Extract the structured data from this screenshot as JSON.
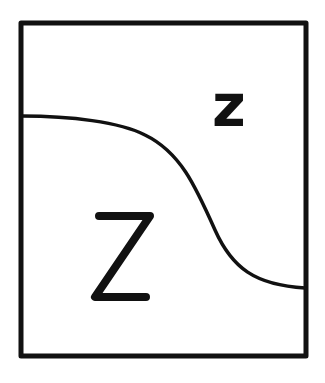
{
  "diagram": {
    "type": "region-partition",
    "frame": {
      "x": 21,
      "y": 23,
      "width": 285,
      "height": 333,
      "stroke": "#111111",
      "stroke_width": 5
    },
    "boundary_curve": {
      "stroke": "#111111",
      "stroke_width": 3.5,
      "path": "M 22 116 C 70 116, 120 122, 145 135 C 180 152, 195 185, 215 230 C 232 268, 255 285, 305 288"
    },
    "regions": [
      {
        "id": "upper-right-region",
        "label": "z",
        "label_style": "small",
        "label_x": 229,
        "label_y": 126,
        "font_size": 58
      },
      {
        "id": "lower-left-region",
        "label": "Z",
        "label_style": "large",
        "label_x": 122,
        "label_y": 301,
        "font_size": 120
      }
    ]
  },
  "colors": {
    "background": "#ffffff",
    "ink": "#111111"
  }
}
